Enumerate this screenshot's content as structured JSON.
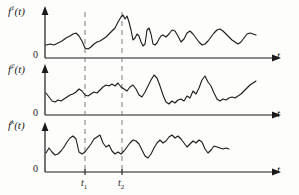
{
  "figure": {
    "background_color": "#fdfdfc",
    "stroke_color": "#1a1a1a",
    "dash_color": "#7a7a7a"
  },
  "panels": [
    {
      "id": "panel-1",
      "ylabel": "f",
      "ysuper": "1",
      "ylabel_suffix": "(t)",
      "zero_label": "0",
      "xlabel": "t"
    },
    {
      "id": "panel-2",
      "ylabel": "f",
      "ysuper": "2",
      "ylabel_suffix": "(t)",
      "zero_label": "0",
      "xlabel": "t"
    },
    {
      "id": "panel-3",
      "ylabel": "f",
      "ysuper": "k",
      "ylabel_suffix": "(t)",
      "zero_label": "0",
      "xlabel": "t"
    }
  ],
  "markers": [
    {
      "name": "t1",
      "label": "t",
      "sub": "1",
      "x": 85
    },
    {
      "name": "t2",
      "label": "t",
      "sub": "2",
      "x": 122
    }
  ],
  "chart_data": {
    "type": "line",
    "xlabel": "t",
    "ylabel": "f(t)",
    "grid": false,
    "legend": "none",
    "axis_origin_x": 45,
    "axis_end_x": 272,
    "xlim": [
      45,
      272
    ],
    "ylim": [
      0,
      1
    ],
    "vertical_markers": [
      {
        "label": "t1",
        "x": 85
      },
      {
        "label": "t2",
        "x": 122
      }
    ],
    "series": [
      {
        "name": "f^1(t)",
        "baseline_y": 58,
        "top_y": 10,
        "points": [
          [
            46,
            45
          ],
          [
            50,
            44
          ],
          [
            54,
            45
          ],
          [
            58,
            43
          ],
          [
            62,
            41
          ],
          [
            66,
            38
          ],
          [
            70,
            36
          ],
          [
            73,
            34
          ],
          [
            76,
            33
          ],
          [
            79,
            36
          ],
          [
            82,
            41
          ],
          [
            85,
            48
          ],
          [
            88,
            49
          ],
          [
            91,
            47
          ],
          [
            94,
            44
          ],
          [
            97,
            42
          ],
          [
            100,
            41
          ],
          [
            103,
            39
          ],
          [
            106,
            37
          ],
          [
            109,
            34
          ],
          [
            112,
            31
          ],
          [
            115,
            28
          ],
          [
            118,
            22
          ],
          [
            121,
            17
          ],
          [
            123,
            15
          ],
          [
            125,
            19
          ],
          [
            127,
            16
          ],
          [
            129,
            22
          ],
          [
            131,
            30
          ],
          [
            133,
            40
          ],
          [
            135,
            38
          ],
          [
            137,
            34
          ],
          [
            139,
            36
          ],
          [
            141,
            42
          ],
          [
            143,
            46
          ],
          [
            145,
            44
          ],
          [
            147,
            30
          ],
          [
            149,
            28
          ],
          [
            151,
            34
          ],
          [
            153,
            44
          ],
          [
            155,
            45
          ],
          [
            157,
            43
          ],
          [
            159,
            39
          ],
          [
            161,
            36
          ],
          [
            163,
            35
          ],
          [
            166,
            37
          ],
          [
            169,
            34
          ],
          [
            172,
            30
          ],
          [
            175,
            31
          ],
          [
            178,
            36
          ],
          [
            181,
            42
          ],
          [
            184,
            39
          ],
          [
            187,
            33
          ],
          [
            190,
            31
          ],
          [
            193,
            34
          ],
          [
            196,
            38
          ],
          [
            199,
            42
          ],
          [
            202,
            45
          ],
          [
            205,
            44
          ],
          [
            208,
            41
          ],
          [
            211,
            37
          ],
          [
            214,
            33
          ],
          [
            217,
            30
          ],
          [
            220,
            29
          ],
          [
            223,
            31
          ],
          [
            226,
            34
          ],
          [
            229,
            37
          ],
          [
            232,
            40
          ],
          [
            235,
            42
          ],
          [
            238,
            44
          ],
          [
            241,
            42
          ],
          [
            244,
            38
          ],
          [
            247,
            34
          ],
          [
            250,
            33
          ],
          [
            253,
            34
          ],
          [
            256,
            35
          ]
        ]
      },
      {
        "name": "f^2(t)",
        "baseline_y": 115,
        "top_y": 68,
        "points": [
          [
            46,
            93
          ],
          [
            49,
            97
          ],
          [
            52,
            101
          ],
          [
            55,
            102
          ],
          [
            58,
            100
          ],
          [
            61,
            101
          ],
          [
            64,
            99
          ],
          [
            67,
            97
          ],
          [
            70,
            95
          ],
          [
            73,
            94
          ],
          [
            76,
            92
          ],
          [
            79,
            89
          ],
          [
            82,
            91
          ],
          [
            85,
            95
          ],
          [
            88,
            96
          ],
          [
            91,
            94
          ],
          [
            94,
            92
          ],
          [
            97,
            93
          ],
          [
            100,
            90
          ],
          [
            103,
            87
          ],
          [
            106,
            85
          ],
          [
            109,
            86
          ],
          [
            112,
            84
          ],
          [
            115,
            86
          ],
          [
            118,
            83
          ],
          [
            121,
            87
          ],
          [
            124,
            89
          ],
          [
            127,
            91
          ],
          [
            130,
            87
          ],
          [
            133,
            85
          ],
          [
            136,
            89
          ],
          [
            139,
            95
          ],
          [
            142,
            97
          ],
          [
            145,
            92
          ],
          [
            148,
            86
          ],
          [
            151,
            80
          ],
          [
            154,
            75
          ],
          [
            157,
            78
          ],
          [
            160,
            86
          ],
          [
            163,
            95
          ],
          [
            166,
            102
          ],
          [
            169,
            104
          ],
          [
            172,
            101
          ],
          [
            175,
            103
          ],
          [
            178,
            100
          ],
          [
            181,
            99
          ],
          [
            184,
            101
          ],
          [
            187,
            96
          ],
          [
            190,
            98
          ],
          [
            193,
            91
          ],
          [
            196,
            94
          ],
          [
            199,
            88
          ],
          [
            202,
            80
          ],
          [
            205,
            76
          ],
          [
            208,
            82
          ],
          [
            211,
            86
          ],
          [
            214,
            93
          ],
          [
            217,
            99
          ],
          [
            220,
            101
          ],
          [
            223,
            99
          ],
          [
            226,
            100
          ],
          [
            229,
            98
          ],
          [
            232,
            97
          ],
          [
            235,
            98
          ],
          [
            238,
            96
          ],
          [
            241,
            94
          ],
          [
            244,
            91
          ],
          [
            247,
            88
          ],
          [
            250,
            85
          ],
          [
            253,
            83
          ],
          [
            256,
            81
          ]
        ]
      },
      {
        "name": "f^k(t)",
        "baseline_y": 172,
        "top_y": 126,
        "points": [
          [
            46,
            153
          ],
          [
            49,
            148
          ],
          [
            52,
            152
          ],
          [
            55,
            155
          ],
          [
            58,
            154
          ],
          [
            61,
            151
          ],
          [
            64,
            147
          ],
          [
            67,
            142
          ],
          [
            70,
            138
          ],
          [
            73,
            136
          ],
          [
            76,
            139
          ],
          [
            79,
            152
          ],
          [
            82,
            154
          ],
          [
            85,
            152
          ],
          [
            88,
            148
          ],
          [
            91,
            144
          ],
          [
            94,
            139
          ],
          [
            97,
            137
          ],
          [
            100,
            135
          ],
          [
            103,
            143
          ],
          [
            106,
            147
          ],
          [
            109,
            145
          ],
          [
            112,
            151
          ],
          [
            115,
            154
          ],
          [
            118,
            152
          ],
          [
            121,
            154
          ],
          [
            124,
            151
          ],
          [
            127,
            147
          ],
          [
            130,
            143
          ],
          [
            133,
            140
          ],
          [
            136,
            141
          ],
          [
            139,
            144
          ],
          [
            142,
            150
          ],
          [
            145,
            156
          ],
          [
            148,
            158
          ],
          [
            151,
            154
          ],
          [
            154,
            148
          ],
          [
            157,
            143
          ],
          [
            160,
            140
          ],
          [
            163,
            143
          ],
          [
            166,
            141
          ],
          [
            169,
            137
          ],
          [
            172,
            135
          ],
          [
            175,
            138
          ],
          [
            178,
            136
          ],
          [
            181,
            139
          ],
          [
            184,
            143
          ],
          [
            187,
            147
          ],
          [
            190,
            144
          ],
          [
            193,
            141
          ],
          [
            196,
            143
          ],
          [
            199,
            140
          ],
          [
            202,
            142
          ],
          [
            205,
            149
          ],
          [
            208,
            153
          ],
          [
            211,
            150
          ],
          [
            214,
            146
          ],
          [
            217,
            147
          ],
          [
            220,
            148
          ],
          [
            223,
            149
          ],
          [
            226,
            148
          ],
          [
            229,
            149
          ]
        ]
      }
    ]
  }
}
